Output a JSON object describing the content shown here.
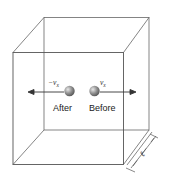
{
  "figure": {
    "labels": {
      "after": "After",
      "before": "Before",
      "velocity_after": "−v",
      "velocity_after_sub": "x",
      "velocity_before": "v",
      "velocity_before_sub": "x",
      "edge_length": "ℓ"
    },
    "colors": {
      "line": "#555555",
      "ball": "#8a8a8a",
      "text": "#222222"
    }
  }
}
